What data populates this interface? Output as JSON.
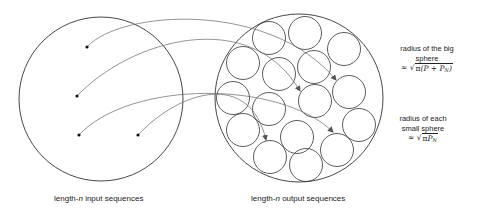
{
  "labels": {
    "input_prefix": "length-",
    "input_var": "n",
    "input_suffix": " input sequences",
    "output_prefix": "length-",
    "output_var": "n",
    "output_suffix": " output sequences"
  },
  "notes": {
    "big": {
      "line1": "radius of the big",
      "line2": "sphere",
      "approx": "≈",
      "radical": "√",
      "formula_pi": "π",
      "formula_body": "(P + P",
      "formula_sub": "N",
      "formula_close": ")"
    },
    "small": {
      "line1": "radius of each",
      "line2": "small sphere",
      "approx": "≈",
      "radical": "√",
      "formula_pi": "π",
      "formula_body": "P",
      "formula_sub": "N",
      "formula_close": ""
    }
  },
  "geometry": {
    "input_circle": {
      "cx": 101,
      "cy": 99,
      "r": 82
    },
    "output_circle": {
      "cx": 299,
      "cy": 98,
      "r": 84
    },
    "input_points": [
      [
        87,
        47
      ],
      [
        77,
        96
      ],
      [
        79,
        135
      ],
      [
        138,
        135
      ]
    ],
    "small_spheres_radius": 16.5,
    "small_spheres": [
      [
        269,
        38
      ],
      [
        305,
        33
      ],
      [
        344,
        49
      ],
      [
        243,
        63
      ],
      [
        279,
        74
      ],
      [
        314,
        67
      ],
      [
        349,
        92
      ],
      [
        233,
        98
      ],
      [
        269,
        109
      ],
      [
        315,
        101
      ],
      [
        359,
        125
      ],
      [
        243,
        130
      ],
      [
        297,
        137
      ],
      [
        337,
        150
      ],
      [
        270,
        157
      ],
      [
        306,
        165
      ]
    ],
    "arrows": [
      {
        "from": [
          87,
          47
        ],
        "to": [
          336,
          80
        ],
        "c1": [
          120,
          10
        ],
        "c2": [
          270,
          0
        ]
      },
      {
        "from": [
          77,
          96
        ],
        "to": [
          300,
          91
        ],
        "c1": [
          130,
          40
        ],
        "c2": [
          250,
          5
        ]
      },
      {
        "from": [
          79,
          135
        ],
        "to": [
          333,
          132
        ],
        "c1": [
          130,
          80
        ],
        "c2": [
          280,
          80
        ]
      },
      {
        "from": [
          138,
          135
        ],
        "to": [
          266,
          140
        ],
        "c1": [
          180,
          90
        ],
        "c2": [
          250,
          70
        ]
      }
    ]
  },
  "colors": {
    "stroke": "#333333",
    "curve": "#666666",
    "dot": "#111111"
  }
}
